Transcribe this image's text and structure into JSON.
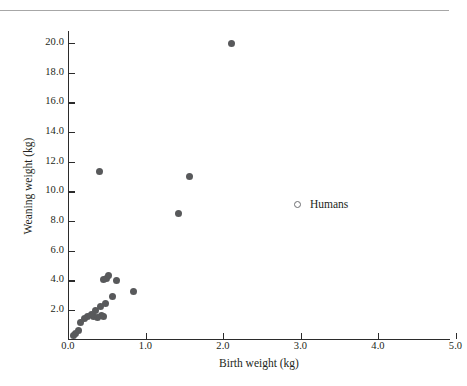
{
  "figure": {
    "top_rule": true,
    "marker_color": "#58595b",
    "axis_color": "#2b2b2b",
    "text_color": "#231f20"
  },
  "legend": {
    "position": "inside-right",
    "marker": "open-circle",
    "label": "Humans"
  },
  "chart_data": {
    "type": "scatter",
    "title": "",
    "xlabel": "Birth weight (kg)",
    "ylabel": "Weaning weight (kg)",
    "xlim": [
      0.0,
      5.0
    ],
    "ylim": [
      0.0,
      20.8
    ],
    "xticks": [
      "0.0",
      "1.0",
      "2.0",
      "3.0",
      "4.0",
      "5.0"
    ],
    "xtick_values": [
      0.0,
      1.0,
      2.0,
      3.0,
      4.0,
      5.0
    ],
    "yticks": [
      "2.0",
      "4.0",
      "6.0",
      "8.0",
      "10.0",
      "12.0",
      "14.0",
      "16.0",
      "18.0",
      "20.0"
    ],
    "ytick_values": [
      2.0,
      4.0,
      6.0,
      8.0,
      10.0,
      12.0,
      14.0,
      16.0,
      18.0,
      20.0
    ],
    "grid": false,
    "series": [
      {
        "name": "Humans",
        "marker": "filled-circle",
        "color": "#58595b",
        "points": [
          {
            "x": 2.11,
            "y": 19.98
          },
          {
            "x": 0.41,
            "y": 11.32
          },
          {
            "x": 1.57,
            "y": 11.0
          },
          {
            "x": 1.43,
            "y": 8.5
          },
          {
            "x": 0.85,
            "y": 3.28
          },
          {
            "x": 0.63,
            "y": 4.0
          },
          {
            "x": 0.5,
            "y": 4.12
          },
          {
            "x": 0.52,
            "y": 4.32
          },
          {
            "x": 0.46,
            "y": 4.08
          },
          {
            "x": 0.57,
            "y": 2.9
          },
          {
            "x": 0.48,
            "y": 2.45
          },
          {
            "x": 0.42,
            "y": 2.22
          },
          {
            "x": 0.36,
            "y": 1.95
          },
          {
            "x": 0.43,
            "y": 1.62
          },
          {
            "x": 0.46,
            "y": 1.58
          },
          {
            "x": 0.38,
            "y": 1.48
          },
          {
            "x": 0.33,
            "y": 1.55
          },
          {
            "x": 0.3,
            "y": 1.72
          },
          {
            "x": 0.25,
            "y": 1.58
          },
          {
            "x": 0.21,
            "y": 1.42
          },
          {
            "x": 0.16,
            "y": 1.18
          },
          {
            "x": 0.13,
            "y": 0.62
          },
          {
            "x": 0.1,
            "y": 0.42
          },
          {
            "x": 0.07,
            "y": 0.3
          }
        ]
      }
    ]
  }
}
